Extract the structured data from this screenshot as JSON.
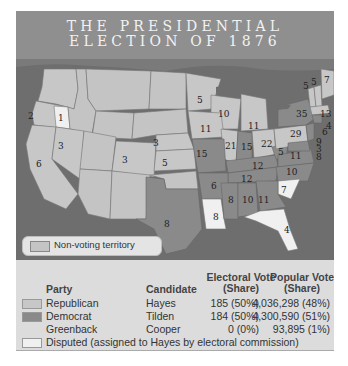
{
  "title": {
    "line1": "THE PRESIDENTIAL",
    "line2": "ELECTION OF 1876"
  },
  "map": {
    "legend": {
      "label": "Non-voting territory",
      "swatch_color": "#c4c4c4"
    },
    "colors": {
      "republican": "#c7c7c7",
      "democrat": "#8a8a8a",
      "disputed": "#f0f0f0",
      "non_voting": "#c4c4c4",
      "water": "#6e6e6e"
    },
    "electoral_labels": [
      {
        "state": "OR",
        "votes": "2"
      },
      {
        "state": "OR-disputed",
        "votes": "1"
      },
      {
        "state": "CA",
        "votes": "6"
      },
      {
        "state": "NV",
        "votes": "3"
      },
      {
        "state": "CO",
        "votes": "3"
      },
      {
        "state": "NE",
        "votes": "3"
      },
      {
        "state": "KS",
        "votes": "5"
      },
      {
        "state": "MN",
        "votes": "5"
      },
      {
        "state": "WI",
        "votes": "10"
      },
      {
        "state": "MI",
        "votes": "11"
      },
      {
        "state": "IA",
        "votes": "11"
      },
      {
        "state": "IL",
        "votes": "21"
      },
      {
        "state": "IN",
        "votes": "15"
      },
      {
        "state": "OH",
        "votes": "22"
      },
      {
        "state": "MO",
        "votes": "15"
      },
      {
        "state": "KY",
        "votes": "12"
      },
      {
        "state": "WV",
        "votes": "5"
      },
      {
        "state": "VA",
        "votes": "11"
      },
      {
        "state": "TN",
        "votes": "12"
      },
      {
        "state": "NC",
        "votes": "10"
      },
      {
        "state": "AR",
        "votes": "6"
      },
      {
        "state": "SC",
        "votes": "7"
      },
      {
        "state": "MS",
        "votes": "8"
      },
      {
        "state": "AL",
        "votes": "10"
      },
      {
        "state": "GA",
        "votes": "11"
      },
      {
        "state": "LA",
        "votes": "8"
      },
      {
        "state": "FL",
        "votes": "4"
      },
      {
        "state": "TX",
        "votes": "8"
      },
      {
        "state": "PA",
        "votes": "29"
      },
      {
        "state": "NY",
        "votes": "35"
      },
      {
        "state": "VT",
        "votes": "5"
      },
      {
        "state": "NH",
        "votes": "5"
      },
      {
        "state": "ME",
        "votes": "7"
      },
      {
        "state": "MA",
        "votes": "13"
      },
      {
        "state": "RI",
        "votes": "4"
      },
      {
        "state": "CT",
        "votes": "6"
      },
      {
        "state": "NJ",
        "votes": "9"
      },
      {
        "state": "DE",
        "votes": "3"
      },
      {
        "state": "MD",
        "votes": "8"
      }
    ]
  },
  "table": {
    "headers": {
      "party": "Party",
      "candidate": "Candidate",
      "electoral_1": "Electoral Vote",
      "electoral_2": "(Share)",
      "popular_1": "Popular Vote",
      "popular_2": "(Share)"
    },
    "rows": [
      {
        "party": "Republican",
        "candidate": "Hayes",
        "electoral": "185 (50%)",
        "popular": "4,036,298 (48%)",
        "swatch": "#c7c7c7"
      },
      {
        "party": "Democrat",
        "candidate": "Tilden",
        "electoral": "184 (50%)",
        "popular": "4,300,590 (51%)",
        "swatch": "#8a8a8a"
      },
      {
        "party": "Greenback",
        "candidate": "Cooper",
        "electoral": "0 (0%)",
        "popular": "93,895 (1%)",
        "swatch": ""
      }
    ],
    "disputed_note": "Disputed (assigned to Hayes by electoral commission)",
    "disputed_swatch": "#f0f0f0"
  }
}
